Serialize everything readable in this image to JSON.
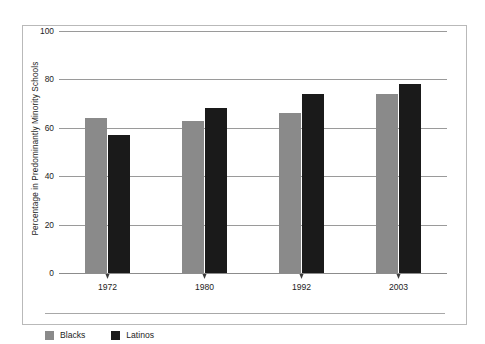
{
  "chart_data": {
    "type": "bar",
    "title": "",
    "xlabel": "",
    "ylabel": "Percentage in Predominantly Minority Schools",
    "categories": [
      "1972",
      "1980",
      "1992",
      "2003"
    ],
    "series": [
      {
        "name": "Blacks",
        "color": "#8a8a8a",
        "values": [
          64,
          63,
          66,
          74
        ]
      },
      {
        "name": "Latinos",
        "color": "#1a1a1a",
        "values": [
          57,
          68,
          74,
          78
        ]
      }
    ],
    "ylim": [
      0,
      100
    ],
    "yticks": [
      0,
      20,
      40,
      60,
      80,
      100
    ],
    "ytick_labels": [
      "0",
      "20",
      "40",
      "60",
      "80",
      "100"
    ],
    "grid": true,
    "legend_position": "bottom-left",
    "frame": true
  }
}
